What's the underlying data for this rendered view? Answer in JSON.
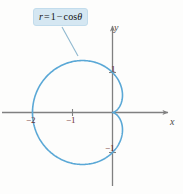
{
  "figure": {
    "equation_label": {
      "r": "r",
      "equals": "=",
      "one": "1",
      "minus": "−",
      "cos": "cos",
      "theta": "θ",
      "full": "r = 1 − cos θ"
    },
    "axes": {
      "x_label": "x",
      "y_label": "y"
    },
    "ticks": {
      "x": [
        "−2",
        "−1"
      ],
      "y": [
        "1",
        "−1"
      ]
    },
    "colors": {
      "curve": "#5aa8d6",
      "axis": "#808080",
      "tick_text": "#6b2b2b",
      "box_fill": "#d5e7f2",
      "box_border": "#c2dcec",
      "leader_line": "#8fb8cf",
      "background": "#fdfdfc"
    }
  },
  "chart_data": {
    "type": "line",
    "subtitle": "",
    "coordinate_system": "polar",
    "equation": "r = 1 - cos(theta)",
    "xlabel": "x",
    "ylabel": "y",
    "xlim": [
      -2.8,
      1.55
    ],
    "ylim": [
      -2.05,
      2.3
    ],
    "grid": false,
    "legend": null,
    "annotations": [
      {
        "text": "r = 1 − cos θ",
        "type": "callout-box",
        "points_to": [
          -0.9,
          1.25
        ]
      }
    ],
    "xticks": [
      -2,
      -1
    ],
    "xticklabels": [
      "−2",
      "−1"
    ],
    "yticks": [
      1,
      -1
    ],
    "yticklabels": [
      "1",
      "−1"
    ],
    "series": [
      {
        "name": "r = 1 - cos(theta)",
        "color": "#5aa8d6",
        "theta_deg": [
          0,
          10,
          20,
          30,
          40,
          50,
          60,
          70,
          80,
          90,
          100,
          110,
          120,
          130,
          140,
          150,
          160,
          170,
          180,
          190,
          200,
          210,
          220,
          230,
          240,
          250,
          260,
          270,
          280,
          290,
          300,
          310,
          320,
          330,
          340,
          350,
          360
        ],
        "r": [
          0.0,
          0.015,
          0.06,
          0.134,
          0.234,
          0.357,
          0.5,
          0.658,
          0.826,
          1.0,
          1.174,
          1.342,
          1.5,
          1.643,
          1.766,
          1.866,
          1.94,
          1.985,
          2.0,
          1.985,
          1.94,
          1.866,
          1.766,
          1.643,
          1.5,
          1.342,
          1.174,
          1.0,
          0.826,
          0.658,
          0.5,
          0.357,
          0.234,
          0.134,
          0.06,
          0.015,
          0.0
        ],
        "x_extent": [
          -2.0,
          0.0
        ],
        "y_extent": [
          -1.3,
          1.3
        ],
        "features": {
          "cusp_at": [
            0,
            0
          ],
          "leftmost_point": [
            -2,
            0
          ],
          "max_r": 2.0,
          "min_r": 0.0
        }
      }
    ]
  }
}
